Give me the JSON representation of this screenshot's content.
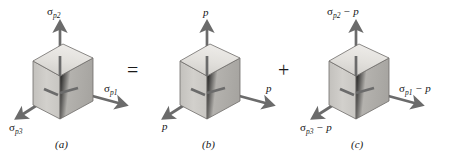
{
  "figure": {
    "kind": "stress-decomposition-diagram",
    "width": 452,
    "height": 158,
    "background": "#ffffff",
    "colors": {
      "cube_top_face": "#dddbd7",
      "cube_left_face": "#cdcbc7",
      "cube_right_face": "#b6b4b0",
      "cube_outline": "#6e6c69",
      "arrow": "#6b6b6b",
      "arrow_dark": "#5d5d5d",
      "text": "#161616"
    }
  },
  "panels": [
    {
      "id": "a",
      "caption": "(a)",
      "labels": {
        "up": {
          "symbol": "σ",
          "sub": "p2",
          "suffix": ""
        },
        "right": {
          "symbol": "σ",
          "sub": "p1",
          "suffix": ""
        },
        "left": {
          "symbol": "σ",
          "sub": "p3",
          "suffix": ""
        }
      }
    },
    {
      "id": "b",
      "caption": "(b)",
      "labels": {
        "up": {
          "symbol": "p",
          "sub": "",
          "suffix": ""
        },
        "right": {
          "symbol": "p",
          "sub": "",
          "suffix": ""
        },
        "left": {
          "symbol": "p",
          "sub": "",
          "suffix": ""
        }
      }
    },
    {
      "id": "c",
      "caption": "(c)",
      "labels": {
        "up": {
          "symbol": "σ",
          "sub": "p2",
          "suffix": " − p"
        },
        "right": {
          "symbol": "σ",
          "sub": "p1",
          "suffix": " − p"
        },
        "left": {
          "symbol": "σ",
          "sub": "p3",
          "suffix": " − p"
        }
      }
    }
  ],
  "operators": [
    {
      "id": "equals",
      "glyph": "="
    },
    {
      "id": "plus",
      "glyph": "+"
    }
  ]
}
